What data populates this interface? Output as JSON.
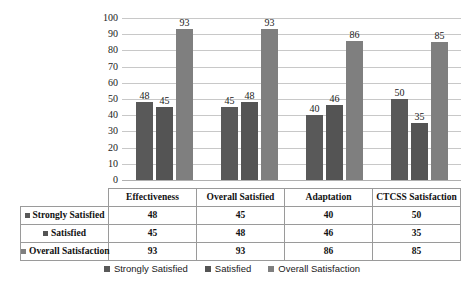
{
  "chart_data": {
    "type": "bar",
    "title": "",
    "subtitle": "",
    "xlabel": "",
    "ylabel": "",
    "ylim": [
      0,
      100
    ],
    "ytick_step": 10,
    "yticks": [
      100,
      90,
      80,
      70,
      60,
      50,
      40,
      30,
      20,
      10,
      0
    ],
    "grid": true,
    "legend_position": "bottom",
    "categories": [
      "Effectiveness",
      "Overall Satisfied",
      "Adaptation",
      "CTCSS Satisfaction"
    ],
    "series": [
      {
        "name": "Strongly Satisfied",
        "color": "#595959",
        "values": [
          48,
          45,
          40,
          50
        ]
      },
      {
        "name": "Satisfied",
        "color": "#545454",
        "values": [
          45,
          48,
          46,
          35
        ]
      },
      {
        "name": "Overall Satisfaction",
        "color": "#7f7f7f",
        "values": [
          93,
          93,
          86,
          85
        ]
      }
    ],
    "data_labels": [
      [
        48,
        45,
        93
      ],
      [
        45,
        48,
        93
      ],
      [
        40,
        46,
        86
      ],
      [
        50,
        35,
        85
      ]
    ]
  },
  "table": {
    "column_headers": [
      "Effectiveness",
      "Overall Satisfied",
      "Adaptation",
      "CTCSS Satisfaction"
    ],
    "rows": [
      {
        "label": "Strongly Satisfied",
        "swatch": "#595959",
        "values": [
          "48",
          "45",
          "40",
          "50"
        ]
      },
      {
        "label": "Satisfied",
        "swatch": "#545454",
        "values": [
          "45",
          "48",
          "46",
          "35"
        ]
      },
      {
        "label": "Overall Satisfaction",
        "swatch": "#7f7f7f",
        "values": [
          "93",
          "93",
          "86",
          "85"
        ]
      }
    ]
  },
  "legend": {
    "items": [
      {
        "label": "Strongly Satisfied",
        "color": "#595959"
      },
      {
        "label": "Satisfied",
        "color": "#545454"
      },
      {
        "label": "Overall Satisfaction",
        "color": "#7f7f7f"
      }
    ]
  },
  "axis": {
    "y_ticks": [
      "100",
      "90",
      "80",
      "70",
      "60",
      "50",
      "40",
      "30",
      "20",
      "10",
      "0"
    ]
  }
}
